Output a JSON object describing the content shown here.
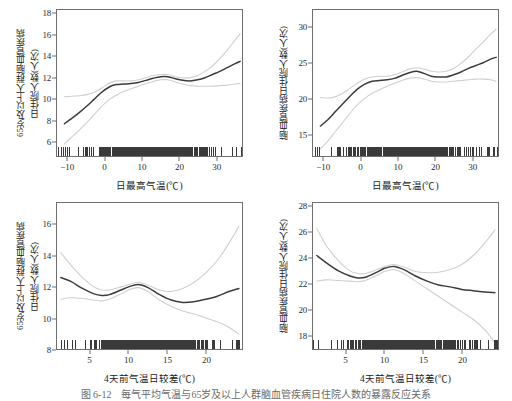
{
  "figure": {
    "caption": "图 6-12　每气平均气温与65岁及以上人群脑血管疾病日住院人数的暴露反应关系"
  },
  "chart_data": [
    {
      "id": "panel-top-left",
      "type": "line",
      "title": "",
      "xlabel": "日最高气温(℃)",
      "ylabel_line1": "65岁及以上人群脑血管疾病",
      "ylabel_line2": "日住院人数(人次)",
      "xlim": [
        -13,
        37
      ],
      "ylim": [
        4.6,
        18.4
      ],
      "xticks": [
        -10,
        0,
        10,
        20,
        30
      ],
      "yticks": [
        6,
        8,
        10,
        12,
        14,
        16,
        18
      ],
      "grid": false,
      "legend": "none",
      "series": [
        {
          "name": "拟合曲线",
          "color": "#3b3b3b",
          "x": [
            -11,
            -9,
            -7,
            -5,
            -3,
            -1,
            1,
            3,
            5,
            7,
            9,
            11,
            13,
            15,
            17,
            19,
            21,
            23,
            25,
            27,
            29,
            31,
            33,
            35,
            36.5
          ],
          "values": [
            7.65,
            8.15,
            8.7,
            9.3,
            9.95,
            10.6,
            11.1,
            11.35,
            11.4,
            11.45,
            11.55,
            11.75,
            11.95,
            12.1,
            12.1,
            11.9,
            11.75,
            11.7,
            11.8,
            12.0,
            12.3,
            12.6,
            12.95,
            13.3,
            13.55
          ]
        },
        {
          "name": "95%置信区间上限",
          "color": "#cfcfcf",
          "x": [
            -11,
            -9,
            -7,
            -5,
            -3,
            -1,
            1,
            3,
            5,
            7,
            9,
            11,
            13,
            15,
            17,
            19,
            21,
            23,
            25,
            27,
            29,
            31,
            33,
            35,
            36.5
          ],
          "values": [
            10.2,
            10.25,
            10.3,
            10.4,
            10.6,
            11.0,
            11.45,
            11.7,
            11.7,
            11.7,
            11.8,
            12.0,
            12.2,
            12.3,
            12.3,
            12.1,
            12.0,
            12.0,
            12.2,
            12.6,
            13.1,
            13.8,
            14.6,
            15.5,
            16.15
          ]
        },
        {
          "name": "95%置信区间下限",
          "color": "#cfcfcf",
          "x": [
            -11,
            -9,
            -7,
            -5,
            -3,
            -1,
            1,
            3,
            5,
            7,
            9,
            11,
            13,
            15,
            17,
            19,
            21,
            23,
            25,
            27,
            29,
            31,
            33,
            35,
            36.5
          ],
          "values": [
            5.75,
            6.4,
            7.05,
            7.75,
            8.5,
            9.25,
            9.9,
            10.35,
            10.7,
            10.95,
            11.2,
            11.45,
            11.65,
            11.8,
            11.8,
            11.6,
            11.4,
            11.25,
            11.2,
            11.2,
            11.2,
            11.25,
            11.3,
            11.4,
            11.45
          ]
        }
      ],
      "rug": true
    },
    {
      "id": "panel-top-right",
      "type": "line",
      "title": "",
      "xlabel": "日最高气温(℃)",
      "ylabel_line1": "脑血管疾病日住院人数(人次)",
      "ylabel_line2": "",
      "xlim": [
        -13,
        37
      ],
      "ylim": [
        12.0,
        32.5
      ],
      "xticks": [
        -10,
        0,
        10,
        20,
        30
      ],
      "yticks": [
        15,
        20,
        25,
        30
      ],
      "grid": false,
      "legend": "none",
      "series": [
        {
          "name": "拟合曲线",
          "color": "#3b3b3b",
          "x": [
            -11,
            -9,
            -7,
            -5,
            -3,
            -1,
            1,
            3,
            5,
            7,
            9,
            11,
            13,
            15,
            17,
            19,
            21,
            23,
            25,
            27,
            29,
            31,
            33,
            35,
            36.5
          ],
          "values": [
            16.2,
            17.1,
            18.2,
            19.3,
            20.4,
            21.4,
            22.1,
            22.5,
            22.6,
            22.7,
            22.9,
            23.3,
            23.7,
            23.9,
            23.6,
            23.2,
            23.1,
            23.1,
            23.4,
            23.8,
            24.3,
            24.7,
            25.1,
            25.6,
            25.85
          ]
        },
        {
          "name": "95%置信区间上限",
          "color": "#cfcfcf",
          "x": [
            -11,
            -9,
            -7,
            -5,
            -3,
            -1,
            1,
            3,
            5,
            7,
            9,
            11,
            13,
            15,
            17,
            19,
            21,
            23,
            25,
            27,
            29,
            31,
            33,
            35,
            36.5
          ],
          "values": [
            20.2,
            20.15,
            20.3,
            20.8,
            21.5,
            22.2,
            22.8,
            23.1,
            23.2,
            23.2,
            23.4,
            23.8,
            24.2,
            24.4,
            24.2,
            23.9,
            23.8,
            23.9,
            24.3,
            25.0,
            25.9,
            27.0,
            28.0,
            29.1,
            29.8
          ]
        },
        {
          "name": "95%置信区间下限",
          "color": "#cfcfcf",
          "x": [
            -11,
            -9,
            -7,
            -5,
            -3,
            -1,
            1,
            3,
            5,
            7,
            9,
            11,
            13,
            15,
            17,
            19,
            21,
            23,
            25,
            27,
            29,
            31,
            33,
            35,
            36.5
          ],
          "values": [
            13.0,
            14.1,
            15.4,
            16.7,
            18.0,
            19.2,
            20.1,
            20.8,
            21.3,
            21.8,
            22.2,
            22.6,
            22.9,
            23.0,
            22.8,
            22.5,
            22.4,
            22.4,
            22.5,
            22.6,
            22.7,
            22.8,
            22.8,
            22.7,
            22.5
          ]
        }
      ],
      "rug": true
    },
    {
      "id": "panel-bottom-left",
      "type": "line",
      "title": "",
      "xlabel": "4天前气温日较差(℃)",
      "ylabel_line1": "65岁及以上人群脑血管疾病",
      "ylabel_line2": "日住院人数(人次)",
      "xlim": [
        0.7,
        24.7
      ],
      "ylim": [
        8.0,
        17.4
      ],
      "xticks": [
        5,
        10,
        15,
        20,
        25
      ],
      "yticks": [
        8,
        10,
        12,
        14,
        16
      ],
      "grid": false,
      "legend": "none",
      "series": [
        {
          "name": "拟合曲线",
          "color": "#3b3b3b",
          "x": [
            1.2,
            2.5,
            4,
            5.5,
            6.5,
            7.5,
            9,
            10,
            11.2,
            12.5,
            14,
            15.5,
            17,
            18.5,
            20,
            21.5,
            23,
            24.3
          ],
          "values": [
            12.6,
            12.35,
            11.9,
            11.55,
            11.45,
            11.5,
            11.8,
            12.0,
            12.15,
            11.95,
            11.5,
            11.15,
            11.0,
            11.05,
            11.2,
            11.4,
            11.7,
            11.9
          ]
        },
        {
          "name": "95%置信区间上限",
          "color": "#cfcfcf",
          "x": [
            1.2,
            2.5,
            4,
            5.5,
            6.5,
            7.5,
            9,
            10,
            11.2,
            12.5,
            14,
            15.5,
            17,
            18.5,
            20,
            21.5,
            23,
            24.3
          ],
          "values": [
            14.2,
            13.4,
            12.6,
            12.0,
            11.8,
            11.8,
            12.0,
            12.15,
            12.3,
            12.1,
            11.8,
            11.7,
            11.9,
            12.3,
            12.9,
            13.7,
            14.8,
            15.9
          ]
        },
        {
          "name": "95%置信区间下限",
          "color": "#cfcfcf",
          "x": [
            1.2,
            2.5,
            4,
            5.5,
            6.5,
            7.5,
            9,
            10,
            11.2,
            12.5,
            14,
            15.5,
            17,
            18.5,
            20,
            21.5,
            23,
            24.3
          ],
          "values": [
            11.2,
            11.3,
            11.25,
            11.15,
            11.1,
            11.2,
            11.55,
            11.8,
            11.95,
            11.7,
            11.15,
            10.75,
            10.45,
            10.25,
            10.0,
            9.75,
            9.4,
            8.95
          ]
        }
      ],
      "rug": true
    },
    {
      "id": "panel-bottom-right",
      "type": "line",
      "title": "",
      "xlabel": "4天前气温日较差(℃)",
      "ylabel_line1": "脑血管疾病日住院人数(人次)",
      "ylabel_line2": "",
      "xlim": [
        0.7,
        24.7
      ],
      "ylim": [
        16.9,
        28.3
      ],
      "xticks": [
        5,
        10,
        15,
        20,
        25
      ],
      "yticks": [
        18,
        20,
        22,
        24,
        26,
        28
      ],
      "grid": false,
      "legend": "none",
      "series": [
        {
          "name": "拟合曲线",
          "color": "#3b3b3b",
          "x": [
            1.2,
            2.5,
            4,
            5.5,
            6.5,
            7.5,
            9,
            10,
            11.2,
            12.5,
            14,
            15.5,
            17,
            18.5,
            20,
            21.5,
            23,
            24.3
          ],
          "values": [
            24.2,
            23.6,
            23.0,
            22.6,
            22.45,
            22.5,
            22.9,
            23.2,
            23.35,
            23.1,
            22.6,
            22.2,
            21.9,
            21.75,
            21.55,
            21.45,
            21.35,
            21.3
          ]
        },
        {
          "name": "95%置信区间上限",
          "color": "#cfcfcf",
          "x": [
            1.2,
            2.5,
            4,
            5.5,
            6.5,
            7.5,
            9,
            10,
            11.2,
            12.5,
            14,
            15.5,
            17,
            18.5,
            20,
            21.5,
            23,
            24.3
          ],
          "values": [
            26.3,
            24.9,
            23.8,
            23.0,
            22.8,
            22.8,
            23.1,
            23.35,
            23.5,
            23.3,
            22.95,
            22.85,
            22.9,
            23.1,
            23.5,
            24.2,
            25.2,
            26.2
          ]
        },
        {
          "name": "95%置信区间下限",
          "color": "#cfcfcf",
          "x": [
            1.2,
            2.5,
            4,
            5.5,
            6.5,
            7.5,
            9,
            10,
            11.2,
            12.5,
            14,
            15.5,
            17,
            18.5,
            20,
            21.5,
            23,
            24.3
          ],
          "values": [
            22.2,
            22.3,
            22.25,
            22.2,
            22.15,
            22.25,
            22.65,
            22.95,
            23.1,
            22.8,
            22.2,
            21.6,
            21.0,
            20.4,
            19.8,
            19.2,
            18.4,
            17.4
          ]
        }
      ],
      "rug": true
    }
  ]
}
